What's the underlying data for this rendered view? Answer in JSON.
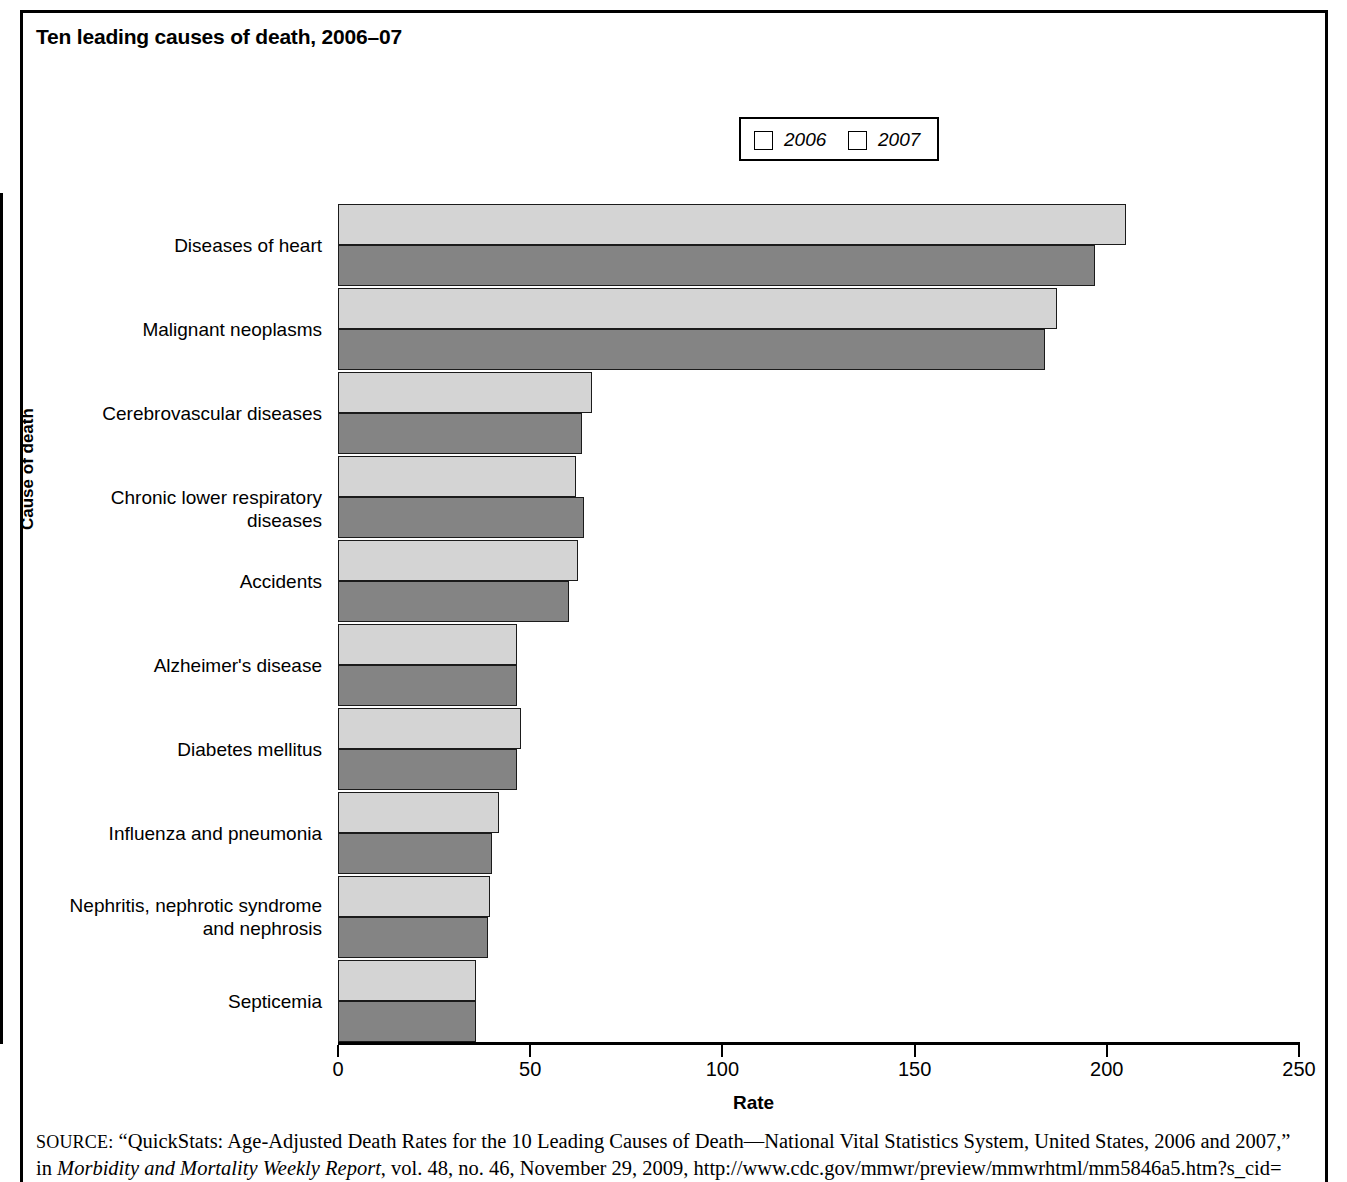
{
  "title": "Ten leading causes of death, 2006–07",
  "legend": {
    "position": "top-center",
    "items": [
      {
        "label": "2006",
        "color": "#d4d4d4"
      },
      {
        "label": "2007",
        "color": "#848484"
      }
    ]
  },
  "axes": {
    "x_title": "Rate",
    "y_title": "Cause of death",
    "x_ticks": [
      "0",
      "50",
      "100",
      "150",
      "200",
      "250"
    ]
  },
  "source": {
    "prefix": "SOURCE:",
    "line1": " “QuickStats: Age-Adjusted Death Rates for the 10 Leading Causes of Death—National Vital Statistics System, United States, 2006 and 2007,”",
    "line2_lead": "in ",
    "line2_italic": "Morbidity and Mortality Weekly Report",
    "line2_rest": ", vol. 48, no. 46, November 29, 2009, http://www.cdc.gov/mmwr/preview/mmwrhtml/mm5846a5.htm?s_cid="
  },
  "chart_data": {
    "type": "bar",
    "orientation": "horizontal",
    "title": "Ten leading causes of death, 2006–07",
    "xlabel": "Rate",
    "ylabel": "Cause of death",
    "xlim": [
      0,
      250
    ],
    "xticks": [
      0,
      50,
      100,
      150,
      200,
      250
    ],
    "grid": false,
    "legend_position": "top-center",
    "categories": [
      "Diseases of heart",
      "Malignant neoplasms",
      "Cerebrovascular diseases",
      "Chronic lower respiratory diseases",
      "Accidents",
      "Alzheimer's disease",
      "Diabetes mellitus",
      "Influenza and pneumonia",
      "Nephritis, nephrotic syndrome\nand nephrosis",
      "Septicemia"
    ],
    "series": [
      {
        "name": "2006",
        "color": "#d4d4d4",
        "values": [
          205.0,
          187.0,
          66.0,
          62.0,
          62.5,
          46.5,
          47.5,
          42.0,
          39.5,
          36.0
        ]
      },
      {
        "name": "2007",
        "color": "#848484",
        "values": [
          197.0,
          184.0,
          63.5,
          64.0,
          60.0,
          46.5,
          46.5,
          40.0,
          39.0,
          36.0
        ]
      }
    ]
  }
}
